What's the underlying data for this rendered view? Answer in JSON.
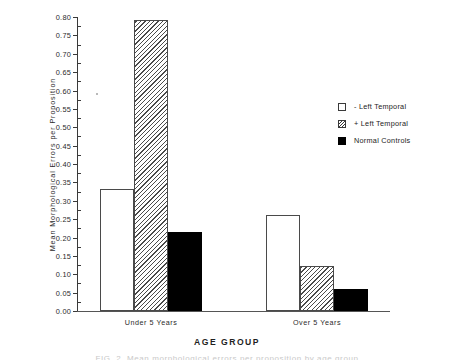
{
  "chart_data": {
    "type": "bar",
    "title": "",
    "xlabel": "AGE GROUP",
    "ylabel": "Mean  Morphological  Errors  per  Proposition",
    "categories": [
      "Under 5 Years",
      "Over 5 Years"
    ],
    "series": [
      {
        "name": "- Left Temporal",
        "style": "open",
        "values": [
          0.333,
          0.262
        ]
      },
      {
        "name": "+ Left Temporal",
        "style": "hatched",
        "values": [
          0.793,
          0.122
        ]
      },
      {
        "name": "Normal Controls",
        "style": "solid",
        "values": [
          0.214,
          0.061
        ]
      }
    ],
    "ylim": [
      0.0,
      0.8
    ],
    "ytick_step": 0.05,
    "ytick_labels": [
      "0.80",
      "0.75",
      "0.70",
      "0.65",
      "0.60",
      "0.55",
      "0.50",
      "0.45",
      "0.40",
      "0.35",
      "0.30",
      "0.25",
      "0.20",
      "0.15",
      "0.10",
      "0.05",
      "0.00"
    ],
    "ytick_values": [
      0.8,
      0.75,
      0.7,
      0.65,
      0.6,
      0.55,
      0.5,
      0.45,
      0.4,
      0.35,
      0.3,
      0.25,
      0.2,
      0.15,
      0.1,
      0.05,
      0.0
    ],
    "grid": false,
    "legend_position": "right-middle",
    "colors": {
      "axis": "#3a3a3a",
      "bar_outline": "#4a4a4a",
      "bar_open_fill": "#ffffff",
      "bar_solid_fill": "#000000",
      "text": "#232323",
      "background": "#ffffff"
    }
  },
  "legend": {
    "items": [
      {
        "label": "- Left Temporal",
        "swatch": "open-square-swatch"
      },
      {
        "label": "+ Left Temporal",
        "swatch": "hatched-square-swatch"
      },
      {
        "label": "Normal Controls",
        "swatch": "filled-square-swatch"
      }
    ]
  },
  "caption": {
    "sliver_text": "FIG. 2. Mean morphological errors per proposition by age group"
  }
}
